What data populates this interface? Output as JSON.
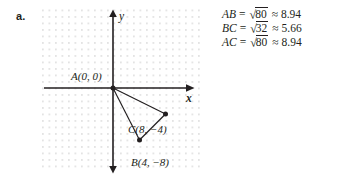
{
  "problem": {
    "label": "a."
  },
  "graph": {
    "axes": {
      "x_label": "x",
      "y_label": "y"
    },
    "grid": {
      "visible": true,
      "dot_color": "#d9d9d9",
      "spacing_units": 1
    },
    "points": [
      {
        "name": "A",
        "label": "A(0, 0)",
        "x": 0,
        "y": 0
      },
      {
        "name": "B",
        "label": "B(4, −8)",
        "x": 4,
        "y": -8
      },
      {
        "name": "C",
        "label": "C(8, −4)",
        "x": 8,
        "y": -4
      }
    ],
    "segments": [
      {
        "from": "A",
        "to": "B"
      },
      {
        "from": "B",
        "to": "C"
      },
      {
        "from": "A",
        "to": "C"
      }
    ]
  },
  "equations": [
    {
      "segment": "AB",
      "equals": "=",
      "sqrt_sign": "√",
      "radicand": "80",
      "approx_sign": "≈",
      "value": "8.94"
    },
    {
      "segment": "BC",
      "equals": "=",
      "sqrt_sign": "√",
      "radicand": "32",
      "approx_sign": "≈",
      "value": "5.66"
    },
    {
      "segment": "AC",
      "equals": "=",
      "sqrt_sign": "√",
      "radicand": "80",
      "approx_sign": "≈",
      "value": "8.94"
    }
  ],
  "colors": {
    "ink": "#231f20",
    "grid_dot": "#d9d9d9"
  }
}
